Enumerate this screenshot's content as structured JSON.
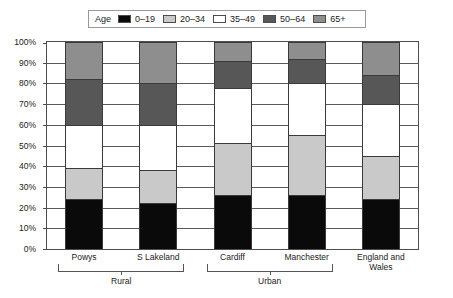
{
  "legend": {
    "title": "Age",
    "items": [
      {
        "label": "0–19",
        "color": "#0a0a0a"
      },
      {
        "label": "20–34",
        "color": "#c9c9c9"
      },
      {
        "label": "35–49",
        "color": "#ffffff"
      },
      {
        "label": "50–64",
        "color": "#575757"
      },
      {
        "label": "65+",
        "color": "#8e8e8e"
      }
    ]
  },
  "chart_data": {
    "type": "bar",
    "subtype": "stacked-percentage",
    "title": "",
    "xlabel": "",
    "ylabel": "",
    "ylim": [
      0,
      100
    ],
    "yunit": "%",
    "grid": true,
    "legend_position": "top",
    "ytick_labels": [
      "0%",
      "10%",
      "20%",
      "30%",
      "40%",
      "50%",
      "60%",
      "70%",
      "80%",
      "90%",
      "100%"
    ],
    "ytick_values": [
      0,
      10,
      20,
      30,
      40,
      50,
      60,
      70,
      80,
      90,
      100
    ],
    "categories": [
      "Powys",
      "S Lakeland",
      "Cardiff",
      "Manchester",
      "England and Wales"
    ],
    "category_display": [
      "Powys",
      "S Lakeland",
      "Cardiff",
      "Manchester",
      "England and\nWales"
    ],
    "groups": [
      {
        "label": "Rural",
        "categories": [
          "Powys",
          "S Lakeland"
        ]
      },
      {
        "label": "Urban",
        "categories": [
          "Cardiff",
          "Manchester"
        ]
      },
      {
        "label": "",
        "categories": [
          "England and Wales"
        ]
      }
    ],
    "series": [
      {
        "name": "0–19",
        "color": "#0a0a0a",
        "values": [
          24,
          22,
          26,
          26,
          24
        ]
      },
      {
        "name": "20–34",
        "color": "#c9c9c9",
        "values": [
          15,
          16,
          25,
          29,
          21
        ]
      },
      {
        "name": "35–49",
        "color": "#ffffff",
        "values": [
          21,
          22,
          27,
          25,
          25
        ]
      },
      {
        "name": "50–64",
        "color": "#575757",
        "values": [
          22,
          20,
          13,
          12,
          14
        ]
      },
      {
        "name": "65+",
        "color": "#8e8e8e",
        "values": [
          18,
          20,
          9,
          8,
          16
        ]
      }
    ]
  }
}
